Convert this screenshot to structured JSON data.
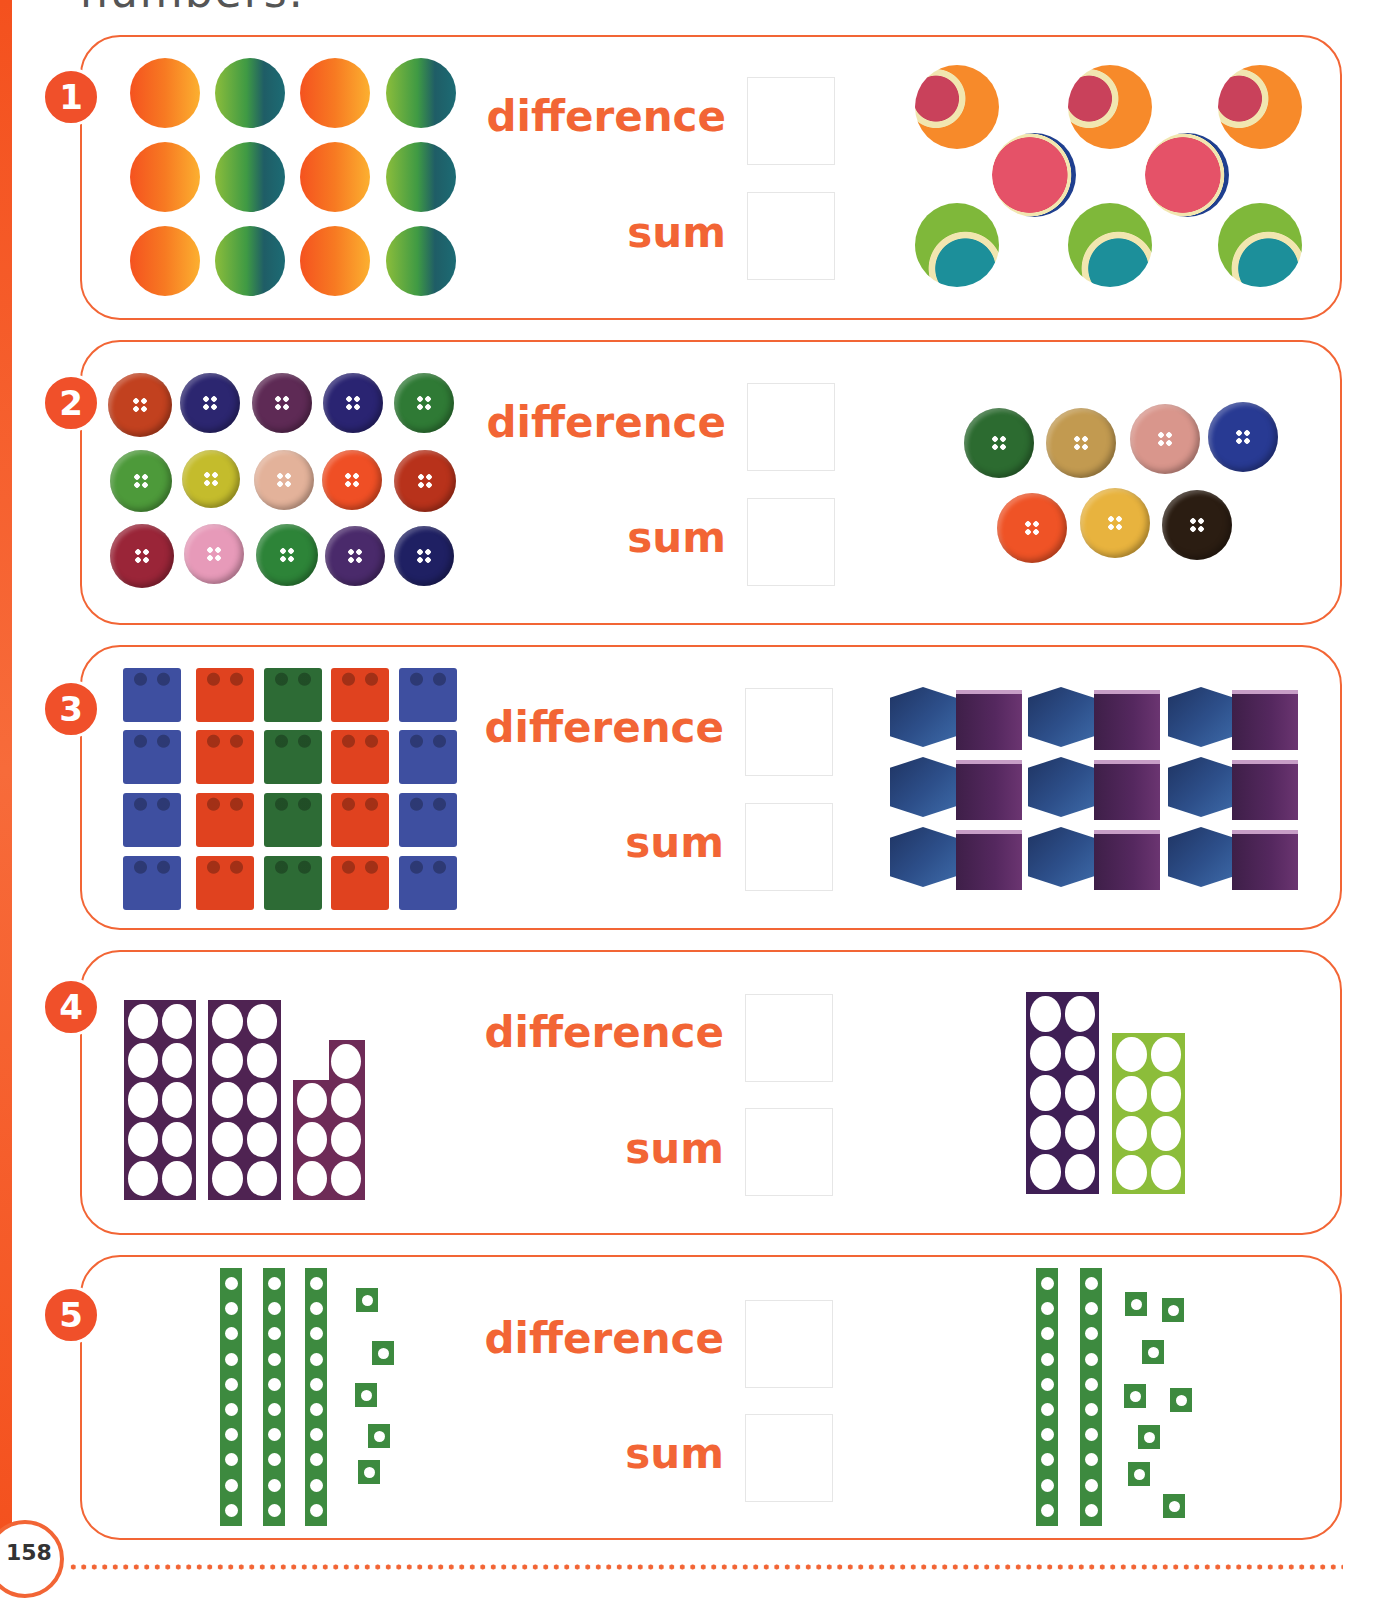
{
  "page": {
    "title_fragment": "numbers.",
    "page_number": "158",
    "accent_color": "#f26535"
  },
  "labels": {
    "difference": "difference",
    "sum": "sum"
  },
  "questions": [
    {
      "number": "1",
      "left_set": "12 bouncy balls (6 orange, 6 green) in a 4x3 grid",
      "right_set": "8 tennis balls",
      "difference_answer": "",
      "sum_answer": ""
    },
    {
      "number": "2",
      "left_set": "15 buttons in a 5x3 grid",
      "right_set": "7 buttons",
      "difference_answer": "",
      "sum_answer": ""
    },
    {
      "number": "3",
      "left_set": "20 toy bricks in a 5x4 grid",
      "right_set": "18 cubes in a 6x3 grid",
      "difference_answer": "",
      "sum_answer": ""
    },
    {
      "number": "4",
      "left_set": "number shapes 10 + 10 + 7",
      "right_set": "number shapes 10 + 8",
      "difference_answer": "",
      "sum_answer": ""
    },
    {
      "number": "5",
      "left_set": "3 ten-rods + 5 units",
      "right_set": "2 ten-rods + 8 units",
      "difference_answer": "",
      "sum_answer": ""
    }
  ]
}
